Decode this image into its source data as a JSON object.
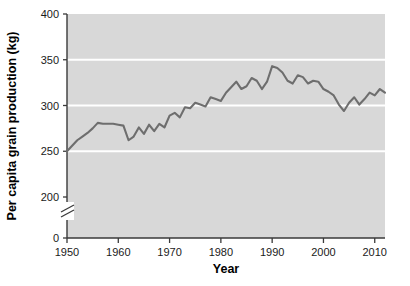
{
  "chart_data": {
    "type": "line",
    "title": "",
    "xlabel": "Year",
    "ylabel": "Per capita grain production (kg)",
    "xlim": [
      1950,
      2012
    ],
    "ylim": [
      0,
      400
    ],
    "y_axis_break": {
      "present": true,
      "between": [
        0,
        200
      ],
      "style": "zigzag"
    },
    "grid": true,
    "gridlines_y": [
      250,
      300,
      350
    ],
    "legend": "none",
    "xticks": [
      1950,
      1960,
      1970,
      1980,
      1990,
      2000,
      2010
    ],
    "xtick_labels": [
      "1950",
      "1960",
      "1970",
      "1980",
      "1990",
      "2000",
      "2010"
    ],
    "yticks": [
      0,
      200,
      250,
      300,
      350,
      400
    ],
    "ytick_labels": [
      "0",
      "200",
      "250",
      "300",
      "350",
      "400"
    ],
    "series": [
      {
        "name": "Per capita grain production",
        "color": "#6e6e6e",
        "x": [
          1950,
          1951,
          1952,
          1953,
          1954,
          1955,
          1956,
          1957,
          1958,
          1959,
          1960,
          1961,
          1962,
          1963,
          1964,
          1965,
          1966,
          1967,
          1968,
          1969,
          1970,
          1971,
          1972,
          1973,
          1974,
          1975,
          1976,
          1977,
          1978,
          1979,
          1980,
          1981,
          1982,
          1983,
          1984,
          1985,
          1986,
          1987,
          1988,
          1989,
          1990,
          1991,
          1992,
          1993,
          1994,
          1995,
          1996,
          1997,
          1998,
          1999,
          2000,
          2001,
          2002,
          2003,
          2004,
          2005,
          2006,
          2007,
          2008,
          2009,
          2010,
          2011,
          2012
        ],
        "values": [
          250,
          256,
          262,
          266,
          270,
          275,
          281,
          280,
          280,
          280,
          279,
          278,
          262,
          266,
          276,
          269,
          279,
          272,
          280,
          276,
          289,
          292,
          287,
          298,
          297,
          303,
          301,
          299,
          309,
          307,
          305,
          314,
          320,
          326,
          318,
          321,
          330,
          327,
          318,
          326,
          343,
          341,
          336,
          327,
          324,
          333,
          331,
          324,
          327,
          326,
          318,
          315,
          311,
          301,
          294,
          303,
          309,
          301,
          307,
          314,
          311,
          318,
          314
        ]
      }
    ]
  },
  "axes": {
    "y_title": "Per capita grain production (kg)",
    "x_title": "Year"
  }
}
